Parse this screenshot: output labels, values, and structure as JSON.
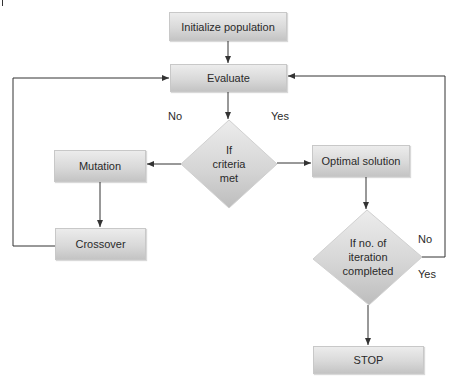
{
  "diagram": {
    "type": "flowchart",
    "nodes": {
      "init": {
        "label": "Initialize population",
        "shape": "rectangle"
      },
      "evaluate": {
        "label": "Evaluate",
        "shape": "rectangle"
      },
      "criteria": {
        "line1": "If",
        "line2": "criteria",
        "line3": "met",
        "shape": "diamond"
      },
      "mutation": {
        "label": "Mutation",
        "shape": "rectangle"
      },
      "crossover": {
        "label": "Crossover",
        "shape": "rectangle"
      },
      "optimal": {
        "label": "Optimal solution",
        "shape": "rectangle"
      },
      "iteration": {
        "line1": "If no. of",
        "line2": "iteration",
        "line3": "completed",
        "shape": "diamond"
      },
      "stop": {
        "label": "STOP",
        "shape": "rectangle"
      }
    },
    "edge_labels": {
      "criteria_no": "No",
      "criteria_yes": "Yes",
      "iteration_no": "No",
      "iteration_yes": "Yes"
    },
    "edges": [
      {
        "from": "Initialize population",
        "to": "Evaluate"
      },
      {
        "from": "Evaluate",
        "to": "If criteria met"
      },
      {
        "from": "If criteria met",
        "to": "Mutation",
        "label": "No"
      },
      {
        "from": "If criteria met",
        "to": "Optimal solution",
        "label": "Yes"
      },
      {
        "from": "Mutation",
        "to": "Crossover"
      },
      {
        "from": "Crossover",
        "to": "Evaluate"
      },
      {
        "from": "Optimal solution",
        "to": "If no. of iteration completed"
      },
      {
        "from": "If no. of iteration completed",
        "to": "Evaluate",
        "label": "No"
      },
      {
        "from": "If no. of iteration completed",
        "to": "STOP",
        "label": "Yes"
      }
    ],
    "colors": {
      "box_top": "#ececec",
      "box_bottom": "#c4c4c4",
      "line": "#333333",
      "text": "#2a2a2a"
    }
  }
}
